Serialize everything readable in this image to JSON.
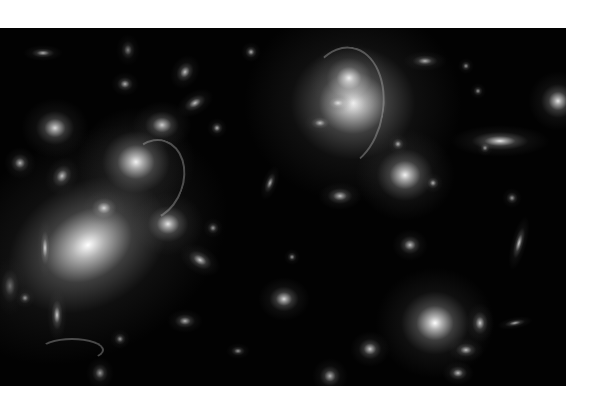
{
  "image": {
    "subject": "galaxy cluster deep field photograph",
    "background_color": "#020202",
    "page_color": "#ffffff"
  },
  "galaxies": [
    {
      "x": 88,
      "y": 217,
      "w": 150,
      "h": 110,
      "core": 1.0,
      "rot": -30
    },
    {
      "x": 353,
      "y": 75,
      "w": 110,
      "h": 100,
      "core": 1.0,
      "rot": 0
    },
    {
      "x": 349,
      "y": 50,
      "w": 40,
      "h": 36,
      "core": 0.9,
      "rot": 0
    },
    {
      "x": 136,
      "y": 134,
      "w": 60,
      "h": 55,
      "core": 0.95,
      "rot": 0
    },
    {
      "x": 162,
      "y": 97,
      "w": 30,
      "h": 24,
      "core": 0.8,
      "rot": 0
    },
    {
      "x": 55,
      "y": 100,
      "w": 34,
      "h": 30,
      "core": 0.85,
      "rot": 0
    },
    {
      "x": 168,
      "y": 196,
      "w": 36,
      "h": 32,
      "core": 0.9,
      "rot": 0
    },
    {
      "x": 104,
      "y": 180,
      "w": 22,
      "h": 18,
      "core": 0.8,
      "rot": 0
    },
    {
      "x": 405,
      "y": 147,
      "w": 50,
      "h": 46,
      "core": 0.95,
      "rot": 0
    },
    {
      "x": 435,
      "y": 295,
      "w": 60,
      "h": 56,
      "core": 1.0,
      "rot": 0
    },
    {
      "x": 500,
      "y": 113,
      "w": 50,
      "h": 16,
      "core": 0.9,
      "rot": 0
    },
    {
      "x": 558,
      "y": 73,
      "w": 30,
      "h": 30,
      "core": 0.9,
      "rot": 0
    },
    {
      "x": 200,
      "y": 232,
      "w": 22,
      "h": 14,
      "core": 0.8,
      "rot": 30
    },
    {
      "x": 284,
      "y": 271,
      "w": 26,
      "h": 22,
      "core": 0.85,
      "rot": 0
    },
    {
      "x": 340,
      "y": 168,
      "w": 22,
      "h": 14,
      "core": 0.75,
      "rot": 0
    },
    {
      "x": 338,
      "y": 75,
      "w": 16,
      "h": 10,
      "core": 0.7,
      "rot": 0
    },
    {
      "x": 425,
      "y": 33,
      "w": 22,
      "h": 10,
      "core": 0.7,
      "rot": 0
    },
    {
      "x": 519,
      "y": 215,
      "w": 8,
      "h": 28,
      "core": 0.8,
      "rot": 15
    },
    {
      "x": 480,
      "y": 295,
      "w": 14,
      "h": 20,
      "core": 0.8,
      "rot": 0
    },
    {
      "x": 466,
      "y": 322,
      "w": 18,
      "h": 12,
      "core": 0.75,
      "rot": 0
    },
    {
      "x": 458,
      "y": 345,
      "w": 16,
      "h": 12,
      "core": 0.75,
      "rot": 0
    },
    {
      "x": 370,
      "y": 321,
      "w": 20,
      "h": 18,
      "core": 0.8,
      "rot": 0
    },
    {
      "x": 410,
      "y": 217,
      "w": 18,
      "h": 16,
      "core": 0.75,
      "rot": 0
    },
    {
      "x": 515,
      "y": 295,
      "w": 18,
      "h": 6,
      "core": 0.7,
      "rot": -10
    },
    {
      "x": 185,
      "y": 44,
      "w": 14,
      "h": 18,
      "core": 0.75,
      "rot": 30
    },
    {
      "x": 195,
      "y": 75,
      "w": 20,
      "h": 12,
      "core": 0.75,
      "rot": -30
    },
    {
      "x": 128,
      "y": 22,
      "w": 12,
      "h": 16,
      "core": 0.5,
      "rot": 0
    },
    {
      "x": 43,
      "y": 25,
      "w": 20,
      "h": 8,
      "core": 0.7,
      "rot": 0
    },
    {
      "x": 251,
      "y": 24,
      "w": 10,
      "h": 10,
      "core": 0.7,
      "rot": 0
    },
    {
      "x": 270,
      "y": 155,
      "w": 8,
      "h": 18,
      "core": 0.7,
      "rot": 20
    },
    {
      "x": 45,
      "y": 220,
      "w": 8,
      "h": 30,
      "core": 0.8,
      "rot": 0
    },
    {
      "x": 57,
      "y": 287,
      "w": 10,
      "h": 26,
      "core": 0.8,
      "rot": 0
    },
    {
      "x": 20,
      "y": 135,
      "w": 16,
      "h": 16,
      "core": 0.7,
      "rot": 0
    },
    {
      "x": 62,
      "y": 148,
      "w": 16,
      "h": 20,
      "core": 0.75,
      "rot": 30
    },
    {
      "x": 25,
      "y": 270,
      "w": 10,
      "h": 10,
      "core": 0.6,
      "rot": 0
    },
    {
      "x": 100,
      "y": 345,
      "w": 14,
      "h": 16,
      "core": 0.6,
      "rot": 0
    },
    {
      "x": 185,
      "y": 293,
      "w": 18,
      "h": 12,
      "core": 0.7,
      "rot": 0
    },
    {
      "x": 238,
      "y": 323,
      "w": 12,
      "h": 8,
      "core": 0.6,
      "rot": 0
    },
    {
      "x": 330,
      "y": 348,
      "w": 18,
      "h": 18,
      "core": 0.7,
      "rot": 0
    },
    {
      "x": 125,
      "y": 56,
      "w": 14,
      "h": 12,
      "core": 0.7,
      "rot": 0
    },
    {
      "x": 217,
      "y": 100,
      "w": 10,
      "h": 10,
      "core": 0.7,
      "rot": 0
    },
    {
      "x": 320,
      "y": 95,
      "w": 16,
      "h": 10,
      "core": 0.7,
      "rot": 0
    },
    {
      "x": 466,
      "y": 38,
      "w": 8,
      "h": 8,
      "core": 0.6,
      "rot": 0
    },
    {
      "x": 478,
      "y": 63,
      "w": 8,
      "h": 8,
      "core": 0.6,
      "rot": 0
    },
    {
      "x": 485,
      "y": 120,
      "w": 8,
      "h": 8,
      "core": 0.6,
      "rot": 0
    },
    {
      "x": 512,
      "y": 170,
      "w": 10,
      "h": 10,
      "core": 0.6,
      "rot": 0
    },
    {
      "x": 433,
      "y": 155,
      "w": 10,
      "h": 10,
      "core": 0.7,
      "rot": 0
    },
    {
      "x": 398,
      "y": 116,
      "w": 10,
      "h": 10,
      "core": 0.7,
      "rot": 0
    },
    {
      "x": 292,
      "y": 229,
      "w": 8,
      "h": 8,
      "core": 0.6,
      "rot": 0
    },
    {
      "x": 213,
      "y": 200,
      "w": 10,
      "h": 10,
      "core": 0.6,
      "rot": 0
    },
    {
      "x": 120,
      "y": 311,
      "w": 10,
      "h": 10,
      "core": 0.6,
      "rot": 0
    },
    {
      "x": 10,
      "y": 258,
      "w": 16,
      "h": 30,
      "core": 0.4,
      "rot": 0
    }
  ],
  "arcs": [
    {
      "x": 300,
      "y": 18,
      "w": 80,
      "h": 120,
      "rot": 10
    },
    {
      "x": 120,
      "y": 110,
      "w": 60,
      "h": 80,
      "rot": 20
    },
    {
      "x": 40,
      "y": 310,
      "w": 60,
      "h": 20,
      "rot": 0
    }
  ]
}
